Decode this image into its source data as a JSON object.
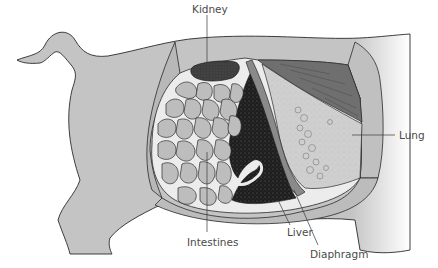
{
  "diagram": {
    "labels": [
      {
        "id": "kidney",
        "text": "Kidney"
      },
      {
        "id": "lung",
        "text": "Lung"
      },
      {
        "id": "intestines",
        "text": "Intestines"
      },
      {
        "id": "liver",
        "text": "Liver"
      },
      {
        "id": "diaphragm",
        "text": "Diaphragm"
      }
    ],
    "colors": {
      "body": "#c4c4c4",
      "body_outline": "#2a2a2a",
      "cut_flap": "#b8b8b8",
      "cavity_bg": "#ececec",
      "intestine": "#bdbdbd",
      "kidney": "#3e3e3e",
      "liver": "#1e1e1e",
      "lung": "#cfcfcf",
      "rib_muscle": "#6f6f6f",
      "label_text": "#4a4a4a",
      "leader_line": "#3a3a3a"
    }
  }
}
